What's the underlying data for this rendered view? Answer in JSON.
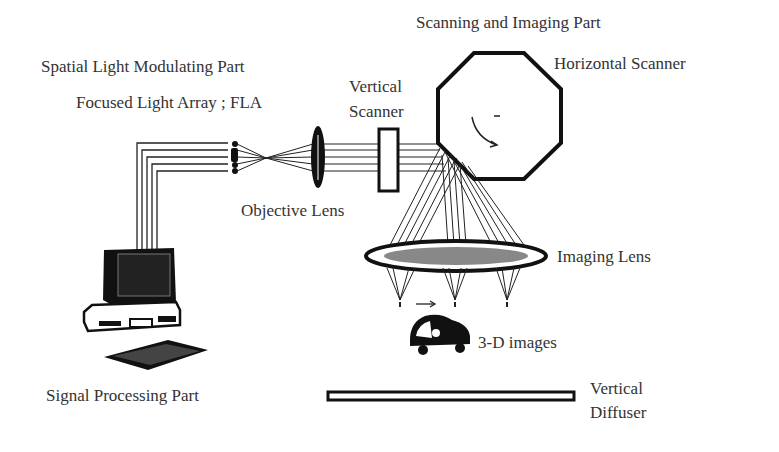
{
  "labels": {
    "scanning_imaging_part": "Scanning and Imaging Part",
    "spatial_light_modulating_part": "Spatial Light Modulating Part",
    "horizontal_scanner": "Horizontal Scanner",
    "focused_light_array": "Focused Light Array ; FLA",
    "vertical_scanner_line1": "Vertical",
    "vertical_scanner_line2": "Scanner",
    "objective_lens": "Objective Lens",
    "imaging_lens": "Imaging Lens",
    "three_d_images": "3-D images",
    "signal_processing_part": "Signal Processing Part",
    "vertical_diffuser_line1": "Vertical",
    "vertical_diffuser_line2": "Diffuser"
  },
  "colors": {
    "ink": "#1a1a1a",
    "background": "#ffffff"
  }
}
